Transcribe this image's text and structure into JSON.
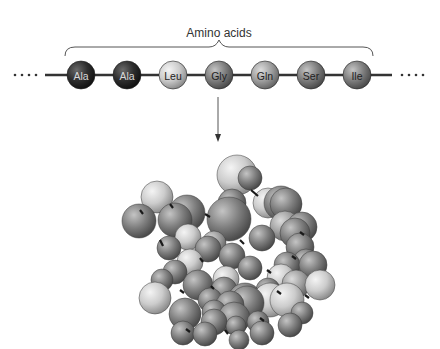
{
  "diagram": {
    "label": "Amino acids",
    "ellipsis_left": "• • • •",
    "ellipsis_right": "• • • •",
    "chain": [
      {
        "name": "Ala",
        "shade": "dark"
      },
      {
        "name": "Ala",
        "shade": "dark"
      },
      {
        "name": "Leu",
        "shade": "light"
      },
      {
        "name": "Gly",
        "shade": "mid"
      },
      {
        "name": "Gln",
        "shade": "midlight"
      },
      {
        "name": "Ser",
        "shade": "mid"
      },
      {
        "name": "Ile",
        "shade": "mid"
      }
    ],
    "arrow": "folds-into",
    "folded_protein": "globular-protein"
  },
  "colors": {
    "dark": "#2b2b2b",
    "mid": "#7a7a7a",
    "midlight": "#9a9a9a",
    "light": "#cfcfcf",
    "line": "#333333",
    "background": "#ffffff"
  }
}
